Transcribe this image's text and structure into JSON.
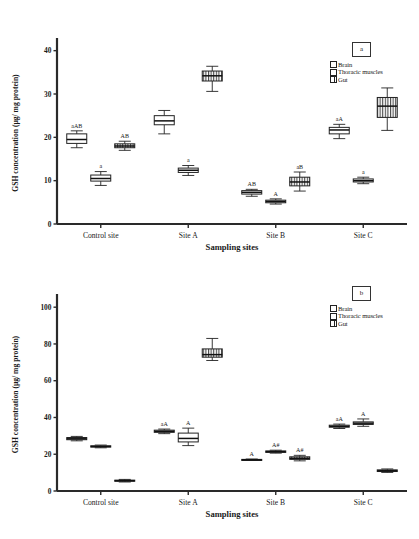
{
  "figure": {
    "panels": [
      "a",
      "b"
    ],
    "legend_entries": [
      "Brain",
      "Thoracic muscles",
      "Gut"
    ],
    "legend_label_a": "a",
    "legend_label_b": "b"
  },
  "chart_data": [
    {
      "type": "box",
      "panel_label": "a",
      "title": "",
      "xlabel": "Sampling sites",
      "ylabel": "GSH concentration (µg/ mg protein)",
      "categories": [
        "Control site",
        "Site A",
        "Site B",
        "Site C"
      ],
      "yticks": [
        0,
        10,
        20,
        30,
        40
      ],
      "ylim": [
        0,
        42
      ],
      "grid": false,
      "legend_position": "top-right",
      "series": [
        {
          "name": "Brain",
          "fill": "open",
          "boxes": [
            {
              "category": "Control site",
              "min": 17.6,
              "q1": 18.6,
              "median": 19.5,
              "q3": 20.8,
              "max": 21.5,
              "annotation": "aAB"
            },
            {
              "category": "Site A",
              "min": 20.8,
              "q1": 22.9,
              "median": 23.8,
              "q3": 25.0,
              "max": 26.2,
              "annotation": ""
            },
            {
              "category": "Site B",
              "min": 6.4,
              "q1": 6.9,
              "median": 7.3,
              "q3": 7.7,
              "max": 8.0,
              "annotation": "AB"
            },
            {
              "category": "Site C",
              "min": 19.7,
              "q1": 20.8,
              "median": 21.7,
              "q3": 22.3,
              "max": 23.0,
              "annotation": "aA"
            }
          ]
        },
        {
          "name": "Thoracic muscles",
          "fill": "open",
          "boxes": [
            {
              "category": "Control site",
              "min": 8.9,
              "q1": 9.9,
              "median": 10.5,
              "q3": 11.3,
              "max": 12.1,
              "annotation": "a"
            },
            {
              "category": "Site A",
              "min": 11.2,
              "q1": 11.9,
              "median": 12.4,
              "q3": 12.9,
              "max": 13.5,
              "annotation": "a"
            },
            {
              "category": "Site B",
              "min": 4.6,
              "q1": 4.9,
              "median": 5.2,
              "q3": 5.5,
              "max": 5.8,
              "annotation": "A"
            },
            {
              "category": "Site C",
              "min": 9.3,
              "q1": 9.7,
              "median": 10.0,
              "q3": 10.4,
              "max": 10.8,
              "annotation": "a"
            }
          ]
        },
        {
          "name": "Gut",
          "fill": "hatched",
          "boxes": [
            {
              "category": "Control site",
              "min": 17.0,
              "q1": 17.6,
              "median": 18.0,
              "q3": 18.5,
              "max": 19.1,
              "annotation": "AB"
            },
            {
              "category": "Site A",
              "min": 30.6,
              "q1": 33.0,
              "median": 34.2,
              "q3": 35.3,
              "max": 36.4,
              "annotation": ""
            },
            {
              "category": "Site B",
              "min": 7.6,
              "q1": 8.8,
              "median": 9.7,
              "q3": 10.8,
              "max": 12.0,
              "annotation": "aB"
            },
            {
              "category": "Site C",
              "min": 21.6,
              "q1": 24.6,
              "median": 27.2,
              "q3": 29.2,
              "max": 31.4,
              "annotation": ""
            }
          ]
        }
      ]
    },
    {
      "type": "box",
      "panel_label": "b",
      "title": "",
      "xlabel": "Sampling sites",
      "ylabel": "GSH concentration (µg/ mg protein)",
      "categories": [
        "Control site",
        "Site A",
        "Site B",
        "Site C"
      ],
      "yticks": [
        0,
        20,
        40,
        60,
        80,
        100
      ],
      "ylim": [
        0,
        105
      ],
      "grid": false,
      "legend_position": "top-right",
      "series": [
        {
          "name": "Brain",
          "fill": "open",
          "boxes": [
            {
              "category": "Control site",
              "min": 27.3,
              "q1": 27.9,
              "median": 28.4,
              "q3": 29.1,
              "max": 29.7,
              "annotation": ""
            },
            {
              "category": "Site A",
              "min": 31.2,
              "q1": 31.9,
              "median": 32.5,
              "q3": 33.1,
              "max": 33.7,
              "annotation": "aA"
            },
            {
              "category": "Site B",
              "min": 16.6,
              "q1": 16.8,
              "median": 17.0,
              "q3": 17.2,
              "max": 17.4,
              "annotation": "A"
            },
            {
              "category": "Site C",
              "min": 34.0,
              "q1": 34.7,
              "median": 35.2,
              "q3": 35.8,
              "max": 36.4,
              "annotation": "aA"
            }
          ]
        },
        {
          "name": "Thoracic muscles",
          "fill": "open",
          "boxes": [
            {
              "category": "Control site",
              "min": 23.5,
              "q1": 23.9,
              "median": 24.2,
              "q3": 24.6,
              "max": 25.0,
              "annotation": ""
            },
            {
              "category": "Site A",
              "min": 24.7,
              "q1": 26.7,
              "median": 28.6,
              "q3": 31.5,
              "max": 34.2,
              "annotation": "A"
            },
            {
              "category": "Site B",
              "min": 20.6,
              "q1": 21.0,
              "median": 21.4,
              "q3": 21.8,
              "max": 22.2,
              "annotation": "A#"
            },
            {
              "category": "Site C",
              "min": 35.2,
              "q1": 36.2,
              "median": 36.9,
              "q3": 37.6,
              "max": 39.2,
              "annotation": "A"
            }
          ]
        },
        {
          "name": "Gut",
          "fill": "hatched",
          "boxes": [
            {
              "category": "Control site",
              "min": 4.9,
              "q1": 5.3,
              "median": 5.6,
              "q3": 5.9,
              "max": 6.3,
              "annotation": ""
            },
            {
              "category": "Site A",
              "min": 71.0,
              "q1": 72.8,
              "median": 74.2,
              "q3": 77.3,
              "max": 83.0,
              "annotation": ""
            },
            {
              "category": "Site B",
              "min": 16.4,
              "q1": 17.2,
              "median": 17.8,
              "q3": 18.6,
              "max": 19.4,
              "annotation": "A#"
            },
            {
              "category": "Site C",
              "min": 10.1,
              "q1": 10.6,
              "median": 11.0,
              "q3": 11.5,
              "max": 12.0,
              "annotation": ""
            }
          ]
        }
      ]
    }
  ]
}
